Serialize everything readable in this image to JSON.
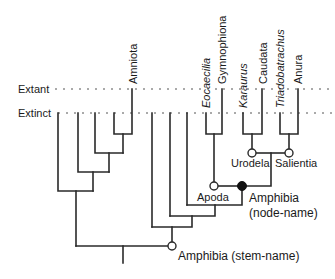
{
  "figure": {
    "type": "cladogram",
    "time_levels": {
      "extant": "Extant",
      "extinct": "Extinct"
    },
    "taxa": [
      {
        "name": "Amniota",
        "italic": false,
        "status": "extant"
      },
      {
        "name": "Eocaecilia",
        "italic": true,
        "status": "extinct"
      },
      {
        "name": "Gymnophiona",
        "italic": false,
        "status": "extant"
      },
      {
        "name": "Karaurus",
        "italic": true,
        "status": "extinct"
      },
      {
        "name": "Caudata",
        "italic": false,
        "status": "extant"
      },
      {
        "name": "Triadobatrachus",
        "italic": true,
        "status": "extinct"
      },
      {
        "name": "Anura",
        "italic": false,
        "status": "extant"
      }
    ],
    "node_labels": {
      "urodela": "Urodela",
      "salientia": "Salientia",
      "apoda": "Apoda",
      "amphibia_node_line1": "Amphibia",
      "amphibia_node_line2": "(node-name)",
      "amphibia_stem": "Amphibia (stem-name)"
    },
    "node_markers": {
      "open_circle": [
        "Urodela",
        "Salientia",
        "Apoda",
        "Amphibia (stem-name)"
      ],
      "filled_circle": [
        "Amphibia (node-name)"
      ]
    },
    "colors": {
      "line": "#2a2a2a",
      "text": "#1a1a1a",
      "dotted": "#555555",
      "background": "#ffffff"
    }
  }
}
